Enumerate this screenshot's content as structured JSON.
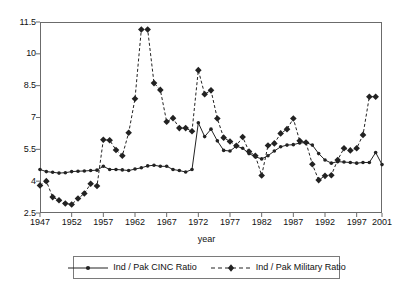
{
  "chart_data": {
    "type": "line",
    "title": "",
    "xlabel": "year",
    "ylabel": "",
    "grid": false,
    "legend_position": "bottom",
    "xlim": [
      1947,
      2001
    ],
    "ylim": [
      2.5,
      11.5
    ],
    "x_ticks": [
      1947,
      1952,
      1957,
      1962,
      1967,
      1972,
      1977,
      1982,
      1987,
      1992,
      1997,
      2001
    ],
    "y_ticks": [
      2.5,
      4,
      5.5,
      7,
      8.5,
      10,
      11.5
    ],
    "x": [
      1947,
      1948,
      1949,
      1950,
      1951,
      1952,
      1953,
      1954,
      1955,
      1956,
      1957,
      1958,
      1959,
      1960,
      1961,
      1962,
      1963,
      1964,
      1965,
      1966,
      1967,
      1968,
      1969,
      1970,
      1971,
      1972,
      1973,
      1974,
      1975,
      1976,
      1977,
      1978,
      1979,
      1980,
      1981,
      1982,
      1983,
      1984,
      1985,
      1986,
      1987,
      1988,
      1989,
      1990,
      1991,
      1992,
      1993,
      1994,
      1995,
      1996,
      1997,
      1998,
      1999,
      2000,
      2001
    ],
    "series": [
      {
        "name": "Ind / Pak CINC Ratio",
        "marker": "circle",
        "linestyle": "solid",
        "color": "#222222",
        "values": [
          4.55,
          4.45,
          4.42,
          4.38,
          4.4,
          4.45,
          4.47,
          4.48,
          4.5,
          4.52,
          4.7,
          4.55,
          4.55,
          4.53,
          4.5,
          4.57,
          4.63,
          4.72,
          4.75,
          4.7,
          4.7,
          4.55,
          4.5,
          4.43,
          4.55,
          6.75,
          6.1,
          6.45,
          5.9,
          5.45,
          5.42,
          5.65,
          5.55,
          5.3,
          5.15,
          5.05,
          5.2,
          5.42,
          5.62,
          5.7,
          5.72,
          5.8,
          5.82,
          5.7,
          5.3,
          5.0,
          4.85,
          4.92,
          4.9,
          4.88,
          4.85,
          4.88,
          4.88,
          5.35,
          4.78
        ]
      },
      {
        "name": "Ind / Pak Military Ratio",
        "marker": "diamond",
        "linestyle": "dashed",
        "color": "#222222",
        "values": [
          3.8,
          4.0,
          3.25,
          3.1,
          2.95,
          2.9,
          3.18,
          3.42,
          3.88,
          3.77,
          5.95,
          5.93,
          5.47,
          5.2,
          6.28,
          7.88,
          11.15,
          11.15,
          8.62,
          8.3,
          6.8,
          6.97,
          6.5,
          6.5,
          6.35,
          9.23,
          8.1,
          8.28,
          6.95,
          6.05,
          5.87,
          5.67,
          6.08,
          5.4,
          5.2,
          4.27,
          5.68,
          5.78,
          6.25,
          6.45,
          6.95,
          5.9,
          5.82,
          4.8,
          4.05,
          4.25,
          4.28,
          5.0,
          5.55,
          5.45,
          5.55,
          6.18,
          7.98,
          7.98,
          null
        ]
      }
    ]
  },
  "axis": {
    "y_tick_labels": [
      "11.5",
      "10",
      "8.5",
      "7",
      "5.5",
      "4",
      "2.5"
    ],
    "x_tick_labels": [
      "1947",
      "1952",
      "1957",
      "1962",
      "1967",
      "1972",
      "1977",
      "1982",
      "1987",
      "1992",
      "1997",
      "2001"
    ],
    "x_title": "year"
  },
  "legend": {
    "entries": [
      {
        "label": "Ind / Pak CINC Ratio",
        "style": "solid-dot"
      },
      {
        "label": "Ind / Pak Military Ratio",
        "style": "dashed-diamond"
      }
    ]
  },
  "colors": {
    "line": "#222222",
    "frame": "#6b6b6b",
    "text": "#111111",
    "background": "#ffffff"
  }
}
